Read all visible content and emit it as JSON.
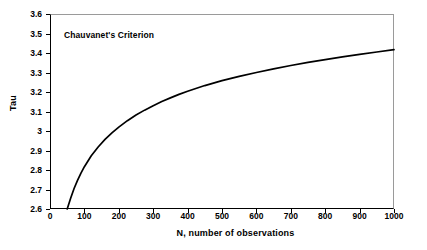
{
  "chart_data": {
    "type": "line",
    "title": "",
    "annotation": "Chauvanet's Criterion",
    "xlabel": "N, number of observations",
    "ylabel": "Tau",
    "xlim": [
      0,
      1000
    ],
    "ylim": [
      2.6,
      3.6
    ],
    "grid": false,
    "legend": false,
    "legend_position": "none",
    "xticks": [
      "0",
      "100",
      "200",
      "300",
      "400",
      "500",
      "600",
      "700",
      "800",
      "900",
      "1000"
    ],
    "xtick_values": [
      0,
      100,
      200,
      300,
      400,
      500,
      600,
      700,
      800,
      900,
      1000
    ],
    "yticks": [
      "2.6",
      "2.7",
      "2.8",
      "2.9",
      "3",
      "3.1",
      "3.2",
      "3.3",
      "3.4",
      "3.5",
      "3.6"
    ],
    "ytick_values": [
      2.6,
      2.7,
      2.8,
      2.9,
      3.0,
      3.1,
      3.2,
      3.3,
      3.4,
      3.5,
      3.6
    ],
    "line_color": "#000000",
    "line_width": 1.6,
    "series": [
      {
        "name": "Tau",
        "x": [
          50,
          60,
          70,
          80,
          90,
          100,
          120,
          140,
          160,
          180,
          200,
          225,
          250,
          275,
          300,
          325,
          350,
          375,
          400,
          450,
          500,
          550,
          600,
          650,
          700,
          750,
          800,
          850,
          900,
          950,
          1000
        ],
        "y": [
          2.6,
          2.655,
          2.705,
          2.747,
          2.784,
          2.817,
          2.873,
          2.918,
          2.957,
          2.99,
          3.02,
          3.053,
          3.082,
          3.107,
          3.13,
          3.151,
          3.17,
          3.188,
          3.204,
          3.233,
          3.258,
          3.28,
          3.3,
          3.319,
          3.336,
          3.352,
          3.366,
          3.38,
          3.393,
          3.405,
          3.417
        ]
      }
    ]
  },
  "axes": {
    "y_title": "Tau",
    "x_title": "N, number of observations"
  }
}
